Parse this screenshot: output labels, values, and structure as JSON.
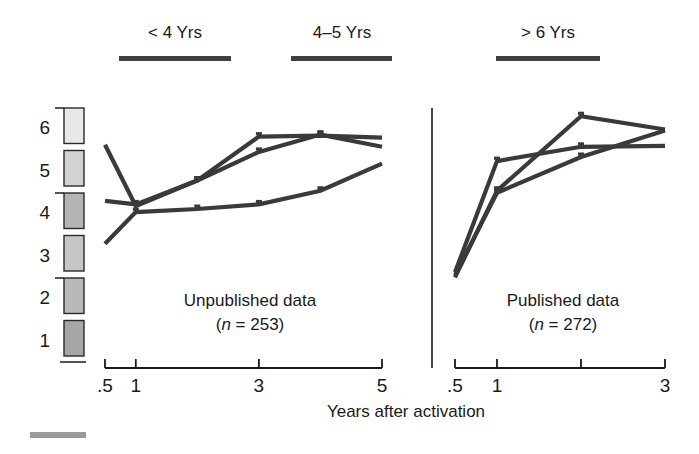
{
  "chart_data": {
    "type": "line",
    "title": "",
    "xlabel": "Years after activation",
    "ylabel": "",
    "ylim": [
      1,
      6
    ],
    "grid": false,
    "legend_position": "top",
    "legend": [
      {
        "label": "< 4 Yrs"
      },
      {
        "label": "4–5 Yrs"
      },
      {
        "label": "> 6 Yrs"
      }
    ],
    "panels": [
      {
        "name": "unpublished",
        "annotation_line1": "Unpublished data",
        "annotation_line2_prefix": "(",
        "annotation_line2_italic": "n",
        "annotation_line2_suffix": " = 253)",
        "xticks": [
          0.5,
          1,
          3,
          5
        ],
        "xtick_labels": [
          ".5",
          "1",
          "3",
          "5"
        ],
        "xlim": [
          0.5,
          5
        ],
        "series": [
          {
            "name": "< 4 Yrs",
            "x": [
              0.5,
              1,
              2,
              3,
              4,
              5
            ],
            "y": [
              5.22,
              4.02,
              4.52,
              5.08,
              5.42,
              5.18
            ]
          },
          {
            "name": "4–5 Yrs",
            "x": [
              0.5,
              1,
              2,
              3,
              4,
              5
            ],
            "y": [
              4.12,
              4.05,
              4.52,
              5.38,
              5.4,
              5.36
            ]
          },
          {
            "name": "> 6 Yrs",
            "x": [
              0.5,
              1,
              2,
              3,
              4,
              5
            ],
            "y": [
              3.28,
              3.9,
              3.96,
              4.05,
              4.32,
              4.85
            ]
          }
        ]
      },
      {
        "name": "published",
        "annotation_line1": "Published data",
        "annotation_line2_prefix": "(",
        "annotation_line2_italic": "n",
        "annotation_line2_suffix": " = 272)",
        "xticks": [
          0.5,
          1,
          2,
          3
        ],
        "xtick_labels": [
          ".5",
          "1",
          "",
          "3"
        ],
        "xlim": [
          0.5,
          3
        ],
        "series": [
          {
            "name": "< 4 Yrs",
            "x": [
              0.5,
              1,
              2,
              3
            ],
            "y": [
              2.72,
              4.9,
              5.18,
              5.2
            ]
          },
          {
            "name": "4–5 Yrs",
            "x": [
              0.5,
              1,
              2,
              3
            ],
            "y": [
              2.62,
              4.32,
              5.78,
              5.52
            ]
          },
          {
            "name": "> 6 Yrs",
            "x": [
              0.5,
              1,
              2,
              3
            ],
            "y": [
              2.66,
              4.28,
              4.98,
              5.5
            ]
          }
        ]
      }
    ],
    "yticks": [
      1,
      2,
      3,
      4,
      5,
      6
    ],
    "ytick_labels": [
      "1",
      "2",
      "3",
      "4",
      "5",
      "6"
    ],
    "y_scalebar_segments": [
      {
        "value": 6,
        "color": "#e8e8e8"
      },
      {
        "value": 5,
        "color": "#d2d2d2"
      },
      {
        "value": 4,
        "color": "#b4b4b4"
      },
      {
        "value": 3,
        "color": "#c6c6c6"
      },
      {
        "value": 2,
        "color": "#b9b9b9"
      },
      {
        "value": 1,
        "color": "#a6a6a6"
      }
    ],
    "colors": {
      "line": "#3a3a3a",
      "axis": "#1a1a1a",
      "legend_bar": "#404040",
      "footer_bar": "#9a9a9a"
    }
  }
}
